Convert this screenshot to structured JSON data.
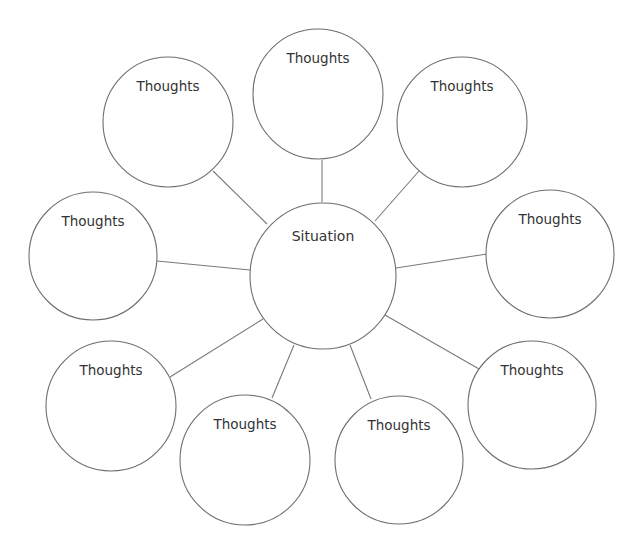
{
  "diagram": {
    "type": "bubble-map",
    "center": {
      "label": "Situation",
      "cx": 323,
      "cy": 276,
      "r": 73
    },
    "nodes": [
      {
        "id": "top",
        "label": "Thoughts",
        "cx": 318,
        "cy": 94,
        "r": 65,
        "line": [
          322,
          160,
          322,
          202
        ]
      },
      {
        "id": "top-left",
        "label": "Thoughts",
        "cx": 168,
        "cy": 122,
        "r": 65,
        "line": [
          213,
          171,
          267,
          224
        ]
      },
      {
        "id": "top-right",
        "label": "Thoughts",
        "cx": 462,
        "cy": 122,
        "r": 65,
        "line": [
          419,
          171,
          375,
          221
        ]
      },
      {
        "id": "left",
        "label": "Thoughts",
        "cx": 93,
        "cy": 256,
        "r": 64,
        "line": [
          157,
          261,
          250,
          270
        ]
      },
      {
        "id": "right",
        "label": "Thoughts",
        "cx": 550,
        "cy": 254,
        "r": 64,
        "line": [
          487,
          254,
          396,
          268
        ]
      },
      {
        "id": "bottom-left",
        "label": "Thoughts",
        "cx": 111,
        "cy": 406,
        "r": 65,
        "line": [
          170,
          377,
          263,
          319
        ]
      },
      {
        "id": "bottom-center-left",
        "label": "Thoughts",
        "cx": 245,
        "cy": 460,
        "r": 65,
        "line": [
          272,
          398,
          294,
          345
        ]
      },
      {
        "id": "bottom-center-right",
        "label": "Thoughts",
        "cx": 399,
        "cy": 460,
        "r": 64,
        "line": [
          371,
          399,
          350,
          345
        ]
      },
      {
        "id": "bottom-right",
        "label": "Thoughts",
        "cx": 532,
        "cy": 405,
        "r": 64,
        "line": [
          479,
          369,
          385,
          315
        ]
      }
    ]
  }
}
